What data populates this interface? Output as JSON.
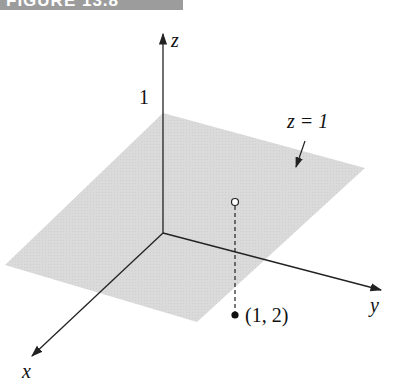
{
  "figure": {
    "banner_label": "FIGURE 13.8"
  },
  "diagram": {
    "axes": {
      "x_label": "x",
      "y_label": "y",
      "z_label": "z"
    },
    "z_tick_label": "1",
    "plane_label": "z = 1",
    "point_label": "(1, 2)",
    "colors": {
      "plane_fill": "#d9d9d9",
      "banner": "#9c9c9c",
      "lines": "#222222"
    }
  }
}
